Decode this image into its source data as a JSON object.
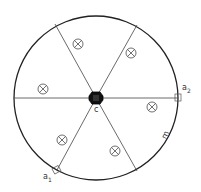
{
  "diagram": {
    "type": "circular wheel with six radial spokes",
    "colors": {
      "stroke": "#222222",
      "hub": "#111111",
      "background": "#ffffff"
    },
    "rim": {
      "cx": 96,
      "cy": 98,
      "r": 82
    },
    "hub": {
      "label": "c"
    },
    "spokes": [
      {
        "x": 55,
        "y": 24
      },
      {
        "x": 137,
        "y": 25
      },
      {
        "x": 14,
        "y": 98
      },
      {
        "x": 178,
        "y": 98
      },
      {
        "x": 57,
        "y": 170
      },
      {
        "x": 137,
        "y": 171
      }
    ],
    "markers": [
      {
        "x": 78,
        "y": 44,
        "symbol": "circle-cross"
      },
      {
        "x": 131,
        "y": 53,
        "symbol": "circle-cross"
      },
      {
        "x": 43,
        "y": 89,
        "symbol": "circle-cross"
      },
      {
        "x": 152,
        "y": 107,
        "symbol": "circle-cross"
      },
      {
        "x": 62,
        "y": 140,
        "symbol": "circle-cross"
      },
      {
        "x": 115,
        "y": 151,
        "symbol": "circle-cross"
      }
    ],
    "labels": {
      "center": "c",
      "a1_base": "a",
      "a1_sub": "1",
      "a2_base": "a",
      "a2_sub": "2",
      "rim": "m"
    }
  }
}
